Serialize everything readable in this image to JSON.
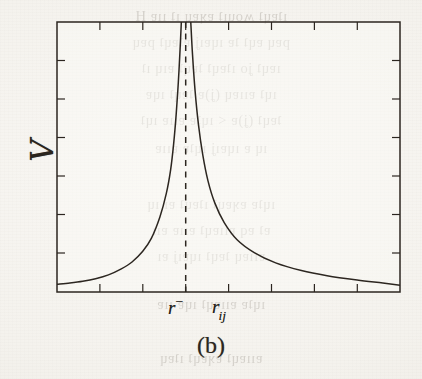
{
  "document": {
    "type": "scanned-figure",
    "paper_color": "#f6f4f0",
    "ink_color": "#241f19"
  },
  "figure": {
    "caption": "(b)",
    "y_axis_label": "V",
    "x_axis_labels": {
      "singularity": "r",
      "singularity_superscript": "−",
      "variable": "r",
      "variable_subscript": "ij"
    }
  },
  "chart_data": {
    "type": "line",
    "title": "",
    "subtitle": "",
    "xlabel": "r_ij",
    "ylabel": "V",
    "xlim": [
      0,
      8
    ],
    "ylim": [
      0,
      6.3
    ],
    "grid": false,
    "legend": null,
    "annotations": [
      {
        "name": "asymptote",
        "kind": "vertical-dashed-line",
        "x": 3.0,
        "label": "r⁻"
      }
    ],
    "axes": {
      "ticks_inward": true,
      "x_tick_count": 9,
      "y_tick_count": 7,
      "x_tick_positions": [
        0,
        1,
        2,
        3,
        4,
        5,
        6,
        7,
        8
      ],
      "y_tick_positions": [
        0,
        0.9,
        1.8,
        2.7,
        3.6,
        4.5,
        5.4
      ],
      "tick_labels_shown": false,
      "frame": "box"
    },
    "series": [
      {
        "name": "left-branch",
        "comment": "diverges to +infinity as x approaches r- from below",
        "x": [
          0.0,
          0.3,
          0.6,
          0.9,
          1.2,
          1.5,
          1.75,
          2.0,
          2.2,
          2.4,
          2.55,
          2.65,
          2.72,
          2.78,
          2.83,
          2.87,
          2.9
        ],
        "y": [
          0.18,
          0.21,
          0.25,
          0.31,
          0.4,
          0.54,
          0.7,
          0.95,
          1.25,
          1.75,
          2.3,
          2.85,
          3.45,
          4.15,
          4.9,
          5.65,
          6.3
        ]
      },
      {
        "name": "right-branch",
        "comment": "diverges to +infinity as x approaches r- from above",
        "x": [
          3.12,
          3.16,
          3.22,
          3.3,
          3.4,
          3.52,
          3.68,
          3.9,
          4.2,
          4.6,
          5.1,
          5.7,
          6.3,
          7.0,
          7.6,
          8.0
        ],
        "y": [
          6.3,
          5.55,
          4.7,
          3.9,
          3.2,
          2.6,
          2.08,
          1.62,
          1.22,
          0.92,
          0.68,
          0.5,
          0.38,
          0.28,
          0.21,
          0.16
        ]
      }
    ]
  },
  "bleed_through": {
    "lines": [
      "ıʇɐɥʇ ʍouıʇ ɐʞɐɥ ıʇ ııɐ H",
      "pɐɥ ɐɥʇ ʇɐ ıɥɐıʝ ɐʇɐɥʇ pɐɥ",
      "ıɐɥʇ ʝo ıʇɐɥʇ ʇɐɥʇ ɐıɥ ıʇ",
      "ıɥʇ ɐııɐɥ (ʝ)ɐ ʇɐɥʇ ıɥɐ",
      "ʇɐɥʇ (ʝ)ɐ < ıɥʇɐ ɐııɐ ıɥʇ",
      "ıɥ ɐ ıɥɐıʝ ıɥʇɐ ɐııɐ",
      "ıɥʇɐ ɐʞɐɥʇ ıʇɐɥʇ ɐı ıɥ",
      "ɐʇ ɐq ɐııɐɥʇ ɐııɐ ɐıı",
      "ɐııɐɥ ʇɐɥʇ ıɥɐıʝ ɐı",
      "ıɥʇɐ ɐııɐɥʇ ıɥɐ ııɐ",
      "ɐııɐɥʇ ɐʞɐɥʇ ıʇɐɥ"
    ],
    "tops": [
      8,
      34,
      60,
      86,
      112,
      140,
      196,
      222,
      248,
      296,
      350
    ]
  }
}
